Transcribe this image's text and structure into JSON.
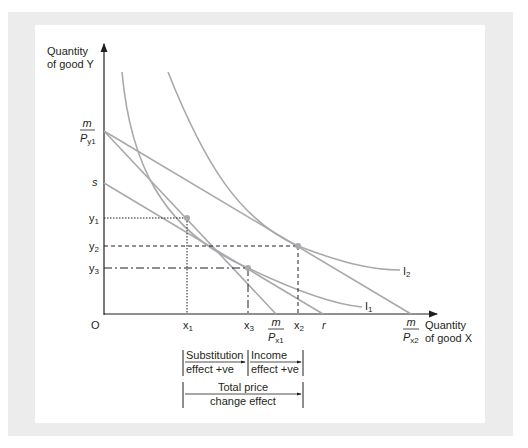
{
  "axes": {
    "y_label_line1": "Quantity",
    "y_label_line2": "of good Y",
    "x_label_line1": "Quantity",
    "x_label_line2": "of good X",
    "origin": "O"
  },
  "y_ticks": {
    "m_py1_num": "m",
    "m_py1_den": "P",
    "m_py1_sub": "y1",
    "s": "s",
    "y1": "y",
    "y1_sub": "1",
    "y2": "y",
    "y2_sub": "2",
    "y3": "y",
    "y3_sub": "3"
  },
  "x_ticks": {
    "x1": "x",
    "x1_sub": "1",
    "x3": "x",
    "x3_sub": "3",
    "m_px1_num": "m",
    "m_px1_den": "P",
    "m_px1_sub": "x1",
    "x2": "x",
    "x2_sub": "2",
    "r": "r",
    "m_px2_num": "m",
    "m_px2_den": "P",
    "m_px2_sub": "x2"
  },
  "curves": {
    "I1": "I",
    "I1_sub": "1",
    "I2": "I",
    "I2_sub": "2"
  },
  "effects": {
    "substitution_line1": "Substitution",
    "substitution_line2": "effect +ve",
    "income_line1": "Income",
    "income_line2": "effect +ve",
    "total_line1": "Total price",
    "total_line2": "change effect"
  },
  "colors": {
    "curve": "#a7a9ac",
    "axis": "#231f20",
    "frame": "#ececec",
    "point": "#a7a9ac"
  }
}
